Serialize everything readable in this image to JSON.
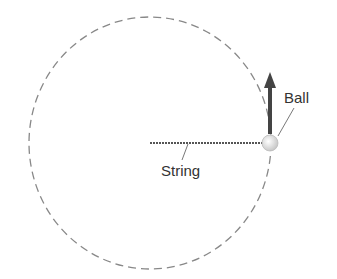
{
  "diagram": {
    "labels": {
      "ball": "Ball",
      "string": "String"
    },
    "elements": {
      "path": "dashed-circular-path",
      "string": "string-line",
      "ball": "ball",
      "velocity": "velocity-arrow"
    },
    "colors": {
      "path": "#888888",
      "string": "#555555",
      "arrow": "#444444",
      "ball": "#dddddd",
      "text": "#333333"
    }
  }
}
